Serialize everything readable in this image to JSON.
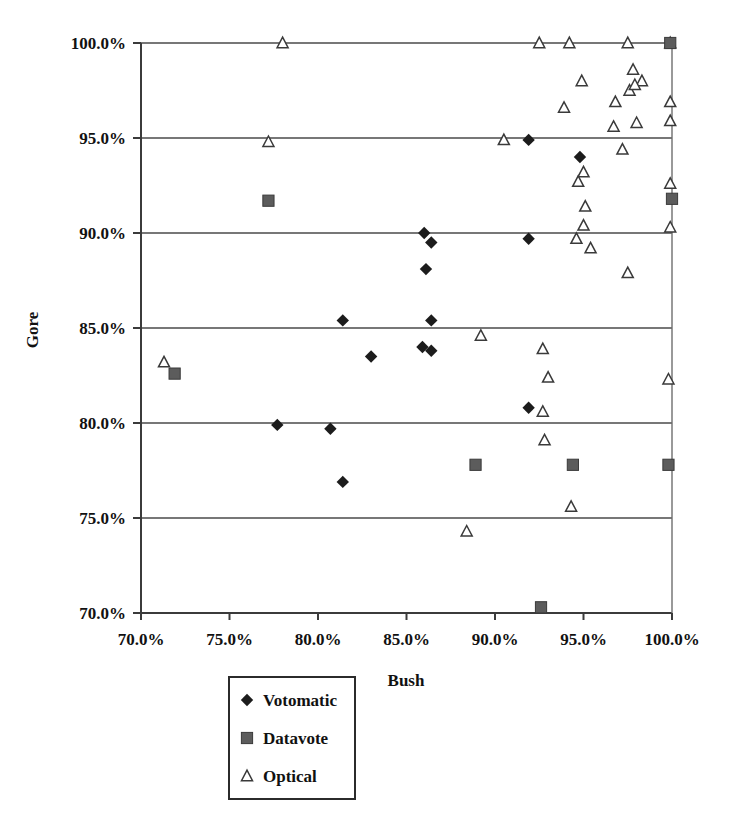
{
  "chart_data": {
    "type": "scatter",
    "title": "",
    "xlabel": "Bush",
    "ylabel": "Gore",
    "xlim": [
      70,
      100
    ],
    "ylim": [
      70,
      100
    ],
    "grid": true,
    "x_ticks": [
      "70.0%",
      "75.0%",
      "80.0%",
      "85.0%",
      "90.0%",
      "95.0%",
      "100.0%"
    ],
    "y_ticks": [
      "70.0%",
      "75.0%",
      "80.0%",
      "85.0%",
      "90.0%",
      "95.0%",
      "100.0%"
    ],
    "x_tick_values": [
      70,
      75,
      80,
      85,
      90,
      95,
      100
    ],
    "y_tick_values": [
      70,
      75,
      80,
      85,
      90,
      95,
      100
    ],
    "legend_position": "bottom-center",
    "series": [
      {
        "name": "Votomatic",
        "marker": "diamond",
        "color": "#1c1c1c",
        "points": [
          [
            86.0,
            90.0
          ],
          [
            86.4,
            89.5
          ],
          [
            91.9,
            89.7
          ],
          [
            86.1,
            88.1
          ],
          [
            94.8,
            94.0
          ],
          [
            91.9,
            94.9
          ],
          [
            81.4,
            85.4
          ],
          [
            86.4,
            85.4
          ],
          [
            85.9,
            84.0
          ],
          [
            86.4,
            83.8
          ],
          [
            83.0,
            83.5
          ],
          [
            91.9,
            80.8
          ],
          [
            77.7,
            79.9
          ],
          [
            80.7,
            79.7
          ],
          [
            81.4,
            76.9
          ]
        ]
      },
      {
        "name": "Datavote",
        "marker": "square",
        "color": "#5c5c5c",
        "points": [
          [
            77.2,
            91.7
          ],
          [
            100.0,
            91.8
          ],
          [
            71.9,
            82.6
          ],
          [
            88.9,
            77.8
          ],
          [
            94.4,
            77.8
          ],
          [
            99.8,
            77.8
          ],
          [
            92.6,
            70.3
          ],
          [
            99.9,
            100.0
          ]
        ]
      },
      {
        "name": "Optical",
        "marker": "triangle",
        "color": "#ffffff",
        "points": [
          [
            78.0,
            100.0
          ],
          [
            92.5,
            100.0
          ],
          [
            94.2,
            100.0
          ],
          [
            97.5,
            100.0
          ],
          [
            99.9,
            100.0
          ],
          [
            94.9,
            98.0
          ],
          [
            97.8,
            98.6
          ],
          [
            98.3,
            98.0
          ],
          [
            97.6,
            97.5
          ],
          [
            93.9,
            96.6
          ],
          [
            97.9,
            97.8
          ],
          [
            96.8,
            96.9
          ],
          [
            99.9,
            96.9
          ],
          [
            96.7,
            95.6
          ],
          [
            98.0,
            95.8
          ],
          [
            99.9,
            95.9
          ],
          [
            97.2,
            94.4
          ],
          [
            90.5,
            94.9
          ],
          [
            77.2,
            94.8
          ],
          [
            95.0,
            93.2
          ],
          [
            94.7,
            92.7
          ],
          [
            99.9,
            92.6
          ],
          [
            95.1,
            91.4
          ],
          [
            95.0,
            90.4
          ],
          [
            99.9,
            90.3
          ],
          [
            94.6,
            89.7
          ],
          [
            95.4,
            89.2
          ],
          [
            97.5,
            87.9
          ],
          [
            89.2,
            84.6
          ],
          [
            92.7,
            83.9
          ],
          [
            93.0,
            82.4
          ],
          [
            99.8,
            82.3
          ],
          [
            92.7,
            80.6
          ],
          [
            92.8,
            79.1
          ],
          [
            94.3,
            75.6
          ],
          [
            88.4,
            74.3
          ],
          [
            71.3,
            83.2
          ]
        ]
      }
    ]
  },
  "legend": {
    "items": [
      {
        "label": "Votomatic",
        "marker": "diamond"
      },
      {
        "label": "Datavote",
        "marker": "square"
      },
      {
        "label": "Optical",
        "marker": "triangle"
      }
    ]
  }
}
